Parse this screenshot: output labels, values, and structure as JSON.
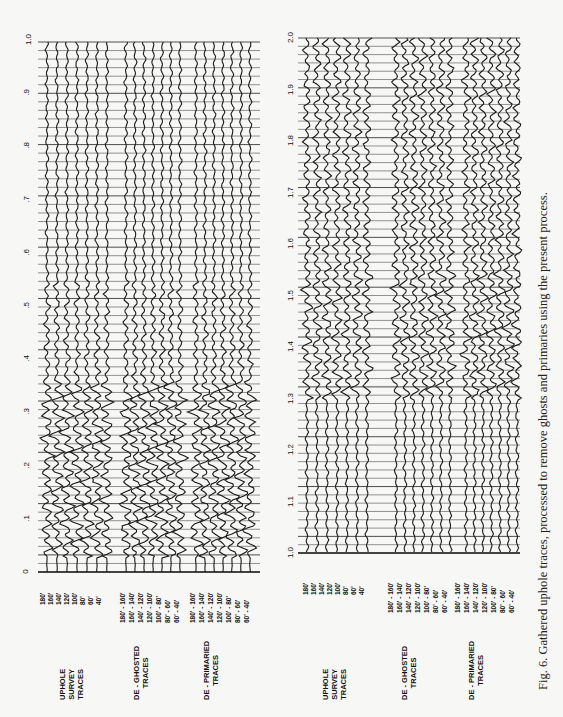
{
  "figure": {
    "caption": "Fig. 6. Gathered uphole traces, processed to remove ghosts and primaries using the present process.",
    "orientation": "rotated 90° counter-clockwise (landscape page)"
  },
  "panels": [
    {
      "id": "left",
      "time_axis": {
        "min": 0,
        "max": 1.0,
        "ticks": [
          "0",
          ".1",
          ".2",
          ".3",
          ".4",
          ".5",
          ".6",
          ".7",
          ".8",
          ".9",
          "1.0"
        ]
      },
      "groups": [
        {
          "title_lines": [
            "UPHOLE",
            "SURVEY",
            "TRACES"
          ],
          "trace_labels": [
            "180'",
            "160'",
            "140'",
            "120'",
            "100'",
            "80'",
            "60'",
            "40'"
          ]
        },
        {
          "title_lines": [
            "DE - GHOSTED",
            "TRACES"
          ],
          "trace_labels": [
            "180' - 160'",
            "160' - 140'",
            "140' - 120'",
            "120' - 100'",
            "100' - 80'",
            "80' - 60'",
            "60' - 40'"
          ]
        },
        {
          "title_lines": [
            "DE - PRIMARIED",
            "TRACES"
          ],
          "trace_labels": [
            "180' - 160'",
            "160' - 140'",
            "140' - 120'",
            "120' - 100'",
            "100' - 80'",
            "80' - 60'",
            "60' - 40'"
          ]
        }
      ]
    },
    {
      "id": "right",
      "time_axis": {
        "min": 1.0,
        "max": 2.0,
        "ticks": [
          "1.0",
          "1.1",
          "1.2",
          "1.3",
          "1.4",
          "1.5",
          "1.6",
          "1.7",
          "1.8",
          "1.9",
          "2.0"
        ]
      },
      "groups": [
        {
          "title_lines": [
            "UPHOLE",
            "SURVEY",
            "TRACES"
          ],
          "trace_labels": [
            "180'",
            "160'",
            "140'",
            "120'",
            "100'",
            "80'",
            "60'",
            "40'"
          ]
        },
        {
          "title_lines": [
            "DE - GHOSTED",
            "TRACES"
          ],
          "trace_labels": [
            "180' - 160'",
            "160' - 140'",
            "140' - 120'",
            "120' - 100'",
            "100' - 80'",
            "80' - 60'",
            "60' - 40'"
          ]
        },
        {
          "title_lines": [
            "DE - PRIMARIED",
            "TRACES"
          ],
          "trace_labels": [
            "180' - 160'",
            "160' - 140'",
            "140' - 120'",
            "120' - 100'",
            "100' - 80'",
            "80' - 60'",
            "60' - 40'"
          ]
        }
      ]
    }
  ],
  "style": {
    "ink": "#1a1a1a",
    "grid": "#3a3a3a",
    "paper": "#f7f7f5"
  }
}
